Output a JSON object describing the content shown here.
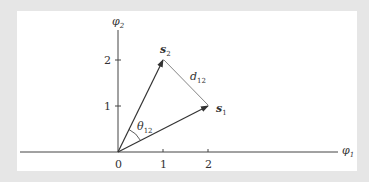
{
  "diagram": {
    "axes": {
      "x_label": "φ",
      "x_label_sub": "1",
      "y_label": "φ",
      "y_label_sub": "2",
      "x_ticks": [
        "0",
        "1",
        "2"
      ],
      "y_ticks": [
        "1",
        "2"
      ]
    },
    "vectors": [
      {
        "name": "s",
        "sub": "1",
        "x": 2,
        "y": 1
      },
      {
        "name": "s",
        "sub": "2",
        "x": 1,
        "y": 2
      }
    ],
    "angle_label": {
      "name": "θ",
      "sub": "12"
    },
    "distance_label": {
      "name": "d",
      "sub": "12"
    },
    "colors": {
      "axis": "#333333",
      "vector": "#333333",
      "dashed": "#555555",
      "background": "#e6e6e6",
      "panel": "#ffffff"
    }
  }
}
